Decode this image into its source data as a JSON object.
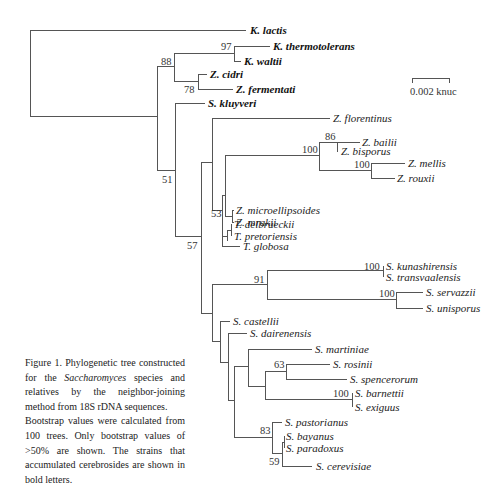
{
  "figure": {
    "scale_bar": {
      "label": "0.002 knuc"
    },
    "taxa": [
      {
        "name": "K. lactis",
        "bold": true
      },
      {
        "name": "K. thermotolerans",
        "bold": true
      },
      {
        "name": "K. waltii",
        "bold": true
      },
      {
        "name": "Z. cidri",
        "bold": true
      },
      {
        "name": "Z. fermentati",
        "bold": true
      },
      {
        "name": "S. kluyveri",
        "bold": true
      },
      {
        "name": "Z. florentinus",
        "bold": false
      },
      {
        "name": "Z. bailii",
        "bold": false
      },
      {
        "name": "Z. bisporus",
        "bold": false
      },
      {
        "name": "Z. mellis",
        "bold": false
      },
      {
        "name": "Z. rouxii",
        "bold": false
      },
      {
        "name": "Z. microellipsoides",
        "bold": false
      },
      {
        "name": "Z. mrakii",
        "bold": false
      },
      {
        "name": "T. delbrueckii",
        "bold": false
      },
      {
        "name": "T. pretoriensis",
        "bold": false
      },
      {
        "name": "T. globosa",
        "bold": false
      },
      {
        "name": "S. kunashirensis",
        "bold": false
      },
      {
        "name": "S. transvaalensis",
        "bold": false
      },
      {
        "name": "S. servazzii",
        "bold": false
      },
      {
        "name": "S. unisporus",
        "bold": false
      },
      {
        "name": "S. castellii",
        "bold": false
      },
      {
        "name": "S. dairenensis",
        "bold": false
      },
      {
        "name": "S. martiniae",
        "bold": false
      },
      {
        "name": "S. rosinii",
        "bold": false
      },
      {
        "name": "S. spencerorum",
        "bold": false
      },
      {
        "name": "S. barnettii",
        "bold": false
      },
      {
        "name": "S. exiguus",
        "bold": false
      },
      {
        "name": "S. pastorianus",
        "bold": false
      },
      {
        "name": "S. bayanus",
        "bold": false
      },
      {
        "name": "S. paradoxus",
        "bold": false
      },
      {
        "name": "S. cerevisiae",
        "bold": false
      }
    ],
    "bootstrap": [
      "97",
      "88",
      "78",
      "51",
      "86",
      "100",
      "100",
      "53",
      "57",
      "100",
      "91",
      "100",
      "63",
      "100",
      "83",
      "59"
    ],
    "caption": {
      "line1_prefix": "Figure 1.  Phylogenetic tree constructed for the ",
      "genus": "Saccharomyces",
      "line1_suffix": " species and relatives by the neighbor-joining method from 18S rDNA sequences.",
      "line2": "Bootstrap values were calculated from 100 trees. Only bootstrap values of >50% are shown.  The strains that accumulated cerebrosides are shown in bold letters."
    }
  }
}
